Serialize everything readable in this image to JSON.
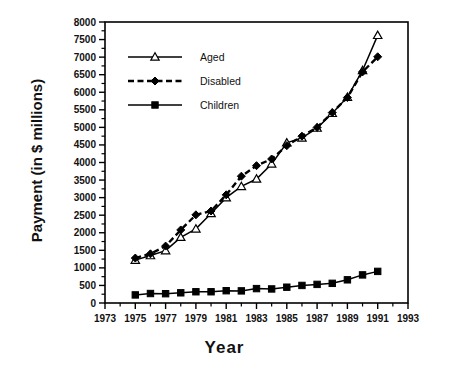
{
  "chart_data": {
    "type": "line",
    "title": "",
    "xlabel": "Year",
    "ylabel": "Payment (in $ millions)",
    "xlim": [
      1973,
      1993
    ],
    "ylim": [
      0,
      8000
    ],
    "xticks": [
      1973,
      1975,
      1977,
      1979,
      1981,
      1983,
      1985,
      1987,
      1989,
      1991,
      1993
    ],
    "xtick_labels": [
      "1973",
      "1975",
      "1977",
      "1979",
      "1981",
      "1983",
      "1985",
      "1987",
      "1989",
      "1991",
      "1993"
    ],
    "xtick_step_minor": 1,
    "yticks": [
      0,
      500,
      1000,
      1500,
      2000,
      2500,
      3000,
      3500,
      4000,
      4500,
      5000,
      5500,
      6000,
      6500,
      7000,
      7500,
      8000
    ],
    "ytick_labels": [
      "0",
      "500",
      "1000",
      "1500",
      "2000",
      "2500",
      "3000",
      "3500",
      "4000",
      "4500",
      "5000",
      "5500",
      "6000",
      "6500",
      "7000",
      "7500",
      "8000"
    ],
    "grid": false,
    "legend_position": "upper-left",
    "x": [
      1975,
      1976,
      1977,
      1978,
      1979,
      1980,
      1981,
      1982,
      1983,
      1984,
      1985,
      1986,
      1987,
      1988,
      1989,
      1990,
      1991
    ],
    "series": [
      {
        "name": "Aged",
        "marker": "triangle",
        "linestyle": "solid",
        "color": "#000000",
        "values": [
          1220,
          1350,
          1490,
          1870,
          2110,
          2550,
          3000,
          3320,
          3530,
          3960,
          4560,
          4700,
          4980,
          5400,
          5860,
          6620,
          7620
        ]
      },
      {
        "name": "Disabled",
        "marker": "diamond",
        "linestyle": "dashed",
        "color": "#000000",
        "values": [
          1280,
          1400,
          1620,
          2080,
          2510,
          2620,
          3080,
          3610,
          3910,
          4100,
          4480,
          4750,
          5000,
          5420,
          5850,
          6580,
          7010
        ]
      },
      {
        "name": "Children",
        "marker": "square",
        "linestyle": "solid",
        "color": "#000000",
        "values": [
          230,
          270,
          265,
          290,
          320,
          320,
          350,
          345,
          410,
          400,
          450,
          500,
          530,
          560,
          660,
          800,
          900
        ]
      }
    ],
    "legend_entries": [
      "Aged",
      "Disabled",
      "Children"
    ]
  },
  "axes": {
    "frame_color": "#000000",
    "background": "#ffffff"
  }
}
